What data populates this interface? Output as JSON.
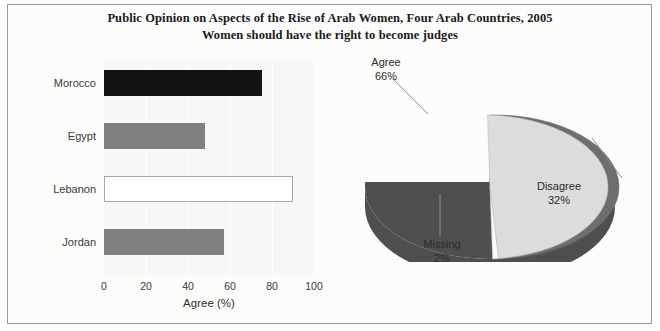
{
  "chart_data": [
    {
      "type": "bar",
      "orientation": "horizontal",
      "title": "Public Opinion on Aspects of the Rise of Arab Women, Four Arab Countries, 2005",
      "subtitle": "Women should have the right to become judges",
      "categories": [
        "Morocco",
        "Egypt",
        "Lebanon",
        "Jordan"
      ],
      "values": [
        75,
        48,
        90,
        57
      ],
      "colors": [
        "#121212",
        "#808080",
        "#ffffff",
        "#808080"
      ],
      "xlabel": "Agree (%)",
      "ylabel": "",
      "xlim": [
        0,
        100
      ],
      "xticks": [
        "0",
        "20",
        "40",
        "60",
        "80",
        "100"
      ],
      "grid": true,
      "legend": "none"
    },
    {
      "type": "pie",
      "three_d": true,
      "labels": [
        "Agree",
        "Disagree",
        "Missing"
      ],
      "values": [
        66,
        32,
        2
      ],
      "value_labels": [
        "66%",
        "32%",
        "2%"
      ],
      "colors": [
        "#6e6e6e",
        "#dcdcdc",
        "#fbfbfb"
      ],
      "legend": "none",
      "label_position": "outside-with-leader-lines"
    }
  ],
  "title": {
    "line1": "Public Opinion on Aspects of the Rise of Arab Women, Four Arab Countries, 2005",
    "line2": "Women should have the right to become judges"
  },
  "bar_chart": {
    "axis_title": "Agree (%)",
    "ticks": [
      "0",
      "20",
      "40",
      "60",
      "80",
      "100"
    ],
    "bars": [
      {
        "label": "Morocco",
        "value": 75,
        "style": "dark"
      },
      {
        "label": "Egypt",
        "value": 48,
        "style": "gray"
      },
      {
        "label": "Lebanon",
        "value": 90,
        "style": "white"
      },
      {
        "label": "Jordan",
        "value": 57,
        "style": "gray"
      }
    ]
  },
  "pie_chart": {
    "slices": [
      {
        "label": "Agree",
        "pct": "66%",
        "value": 66
      },
      {
        "label": "Disagree",
        "pct": "32%",
        "value": 32
      },
      {
        "label": "Missing",
        "pct": "2%",
        "value": 2
      }
    ]
  }
}
